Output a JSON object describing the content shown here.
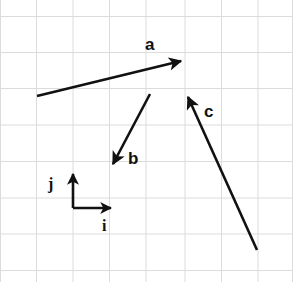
{
  "figure": {
    "width": 293,
    "height": 282,
    "background_color": "#ffffff",
    "stroke_color": "#111111"
  },
  "grid": {
    "line_color": "#dcdcdc",
    "line_width": 1,
    "spacing_px": 36.4,
    "x_lines": [
      0.5,
      36.5,
      73,
      109.5,
      146,
      185,
      221.5,
      258,
      292.5
    ],
    "y_lines": [
      16.5,
      52.5,
      88.5,
      125,
      161.5,
      198,
      234,
      270.5
    ]
  },
  "chart_data": {
    "type": "diagram",
    "coordinate_system": {
      "origin_px": [
        73,
        208
      ],
      "i_unit_px": [
        38,
        0
      ],
      "j_unit_px": [
        0,
        -34
      ]
    },
    "vectors": [
      {
        "name": "a",
        "label": "a",
        "tail_px": [
          37,
          96
        ],
        "head_px": [
          181,
          61
        ],
        "label_px": [
          145,
          50
        ],
        "components_units": [
          3.8,
          0.9
        ],
        "color": "#111111"
      },
      {
        "name": "b",
        "label": "b",
        "tail_px": [
          150,
          94
        ],
        "head_px": [
          113,
          164
        ],
        "label_px": [
          128,
          164
        ],
        "components_units": [
          -1.0,
          -2.1
        ],
        "color": "#111111"
      },
      {
        "name": "c",
        "label": "c",
        "tail_px": [
          257,
          250
        ],
        "head_px": [
          188,
          97
        ],
        "label_px": [
          204,
          117
        ],
        "components_units": [
          -1.8,
          4.5
        ],
        "color": "#111111"
      }
    ],
    "basis_vectors": [
      {
        "name": "i",
        "label": "i",
        "tail_px": [
          73,
          208
        ],
        "head_px": [
          111,
          208
        ],
        "label_px": [
          102,
          231
        ],
        "components_units": [
          1,
          0
        ],
        "color": "#111111"
      },
      {
        "name": "j",
        "label": "j",
        "tail_px": [
          73,
          208
        ],
        "head_px": [
          73,
          174
        ],
        "label_px": [
          48,
          189
        ],
        "components_units": [
          0,
          1
        ],
        "color": "#111111"
      }
    ]
  }
}
